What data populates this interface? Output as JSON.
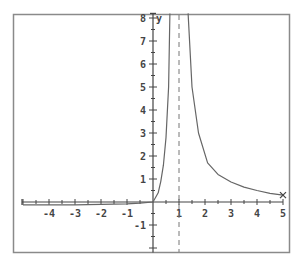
{
  "chart_data": {
    "type": "line",
    "title": "",
    "xlabel": "",
    "ylabel": "y",
    "xlim": [
      -5.2,
      5
    ],
    "ylim": [
      -2.2,
      8.2
    ],
    "grid": false,
    "legend": null,
    "x_ticks": [
      -4,
      -3,
      -2,
      -1,
      1,
      2,
      3,
      4,
      5
    ],
    "x_tick_labels": [
      "-4",
      "-3",
      "-2",
      "-1",
      "1",
      "2",
      "3",
      "4",
      "5"
    ],
    "y_ticks": [
      8,
      7,
      6,
      5,
      4,
      3,
      2,
      1,
      -1
    ],
    "y_tick_labels": [
      "8",
      "7",
      "6",
      "5",
      "4",
      "3",
      "2",
      "1",
      "-1"
    ],
    "minor_tick_step": 0.5,
    "asymptotes": [
      {
        "type": "vertical",
        "x": 1,
        "style": "dashed"
      }
    ],
    "endpoint_marker": {
      "x": 5,
      "y": 0.3,
      "symbol": "x"
    },
    "series": [
      {
        "name": "left branch",
        "x": [
          -5,
          -4,
          -3,
          -2,
          -1,
          -0.5,
          0,
          0.2,
          0.3,
          0.4,
          0.5,
          0.6,
          0.65
        ],
        "y": [
          -0.12,
          -0.12,
          -0.12,
          -0.1,
          -0.08,
          -0.05,
          0,
          0.4,
          0.9,
          1.6,
          2.8,
          5,
          8.2
        ]
      },
      {
        "name": "right branch",
        "x": [
          1.35,
          1.5,
          1.75,
          2.1,
          2.5,
          3,
          3.5,
          4,
          4.5,
          5
        ],
        "y": [
          8.2,
          5,
          3,
          1.7,
          1.2,
          0.87,
          0.65,
          0.5,
          0.38,
          0.3
        ]
      }
    ],
    "colors": {
      "frame": "#8a8a8a",
      "axis": "#444444",
      "curve": "#666666",
      "asymptote": "#777777",
      "background": "#ffffff"
    }
  }
}
